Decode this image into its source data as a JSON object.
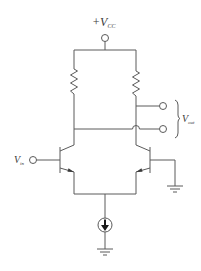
{
  "diagram": {
    "type": "circuit-schematic",
    "labels": {
      "supply": "+V",
      "supply_sub": "CC",
      "input": "V",
      "input_sub": "in",
      "output": "V",
      "output_sub": "out"
    },
    "components": [
      {
        "id": "R1",
        "kind": "resistor",
        "position": "left load"
      },
      {
        "id": "R2",
        "kind": "resistor",
        "position": "right load"
      },
      {
        "id": "Q1",
        "kind": "npn-bjt",
        "position": "left, base driven by V_in"
      },
      {
        "id": "Q2",
        "kind": "npn-bjt",
        "position": "right, base grounded"
      },
      {
        "id": "I_tail",
        "kind": "current-source",
        "direction": "down"
      },
      {
        "id": "GND1",
        "kind": "ground",
        "position": "Q2 base"
      },
      {
        "id": "GND2",
        "kind": "ground",
        "position": "below current source"
      }
    ],
    "terminals": [
      "supply",
      "input",
      "output+",
      "output-"
    ],
    "colors": {
      "wire": "#5a5a5a",
      "background": "#ffffff"
    }
  }
}
